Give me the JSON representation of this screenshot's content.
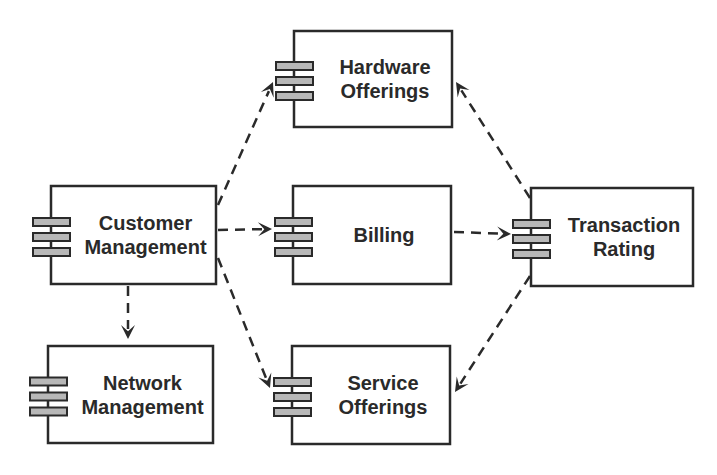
{
  "diagram": {
    "type": "component-dependency-diagram",
    "colors": {
      "stroke": "#2a2a2a",
      "icon_fill": "#b8b8b8",
      "background": "#ffffff"
    },
    "components": [
      {
        "id": "hardware",
        "lines": [
          "Hardware",
          "Offerings"
        ],
        "icon": "component-icon"
      },
      {
        "id": "customer",
        "lines": [
          "Customer",
          "Management"
        ],
        "icon": "component-icon"
      },
      {
        "id": "billing",
        "lines": [
          "Billing"
        ],
        "icon": "component-icon"
      },
      {
        "id": "transaction",
        "lines": [
          "Transaction",
          "Rating"
        ],
        "icon": "component-icon"
      },
      {
        "id": "network",
        "lines": [
          "Network",
          "Management"
        ],
        "icon": "component-icon"
      },
      {
        "id": "service",
        "lines": [
          "Service",
          "Offerings"
        ],
        "icon": "component-icon"
      }
    ],
    "edges": [
      {
        "from": "customer",
        "to": "hardware",
        "style": "dashed"
      },
      {
        "from": "customer",
        "to": "billing",
        "style": "dashed"
      },
      {
        "from": "customer",
        "to": "service",
        "style": "dashed"
      },
      {
        "from": "customer",
        "to": "network",
        "style": "dashed"
      },
      {
        "from": "billing",
        "to": "transaction",
        "style": "dashed"
      },
      {
        "from": "transaction",
        "to": "hardware",
        "style": "dashed"
      },
      {
        "from": "transaction",
        "to": "service",
        "style": "dashed"
      }
    ]
  }
}
